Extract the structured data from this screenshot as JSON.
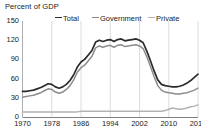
{
  "chart_data": {
    "type": "line",
    "title": "Percent of GDP",
    "xlabel": "",
    "ylabel": "Percent of GDP",
    "ylim": [
      0,
      150
    ],
    "xlim": [
      1970,
      2018
    ],
    "yticks": [
      0,
      30,
      60,
      90,
      120,
      150
    ],
    "xticks": [
      1970,
      1978,
      1986,
      1994,
      2002,
      2010,
      2018
    ],
    "grid": "vertical-major",
    "legend_position": "top",
    "x": [
      1970,
      1971,
      1972,
      1973,
      1974,
      1975,
      1976,
      1977,
      1978,
      1979,
      1980,
      1981,
      1982,
      1983,
      1984,
      1985,
      1986,
      1987,
      1988,
      1989,
      1990,
      1991,
      1992,
      1993,
      1994,
      1995,
      1996,
      1997,
      1998,
      1999,
      2000,
      2001,
      2002,
      2003,
      2004,
      2005,
      2006,
      2007,
      2008,
      2009,
      2010,
      2011,
      2012,
      2013,
      2014,
      2015,
      2016,
      2017,
      2018
    ],
    "series": [
      {
        "name": "Total",
        "color": "#2b2b2b",
        "values": [
          40,
          40,
          41,
          42,
          44,
          46,
          49,
          52,
          51,
          47,
          45,
          47,
          51,
          57,
          66,
          78,
          86,
          90,
          97,
          104,
          117,
          120,
          118,
          120,
          121,
          118,
          121,
          122,
          119,
          120,
          121,
          122,
          120,
          116,
          103,
          88,
          72,
          58,
          51,
          49,
          48,
          47,
          47,
          48,
          50,
          53,
          57,
          62,
          67
        ]
      },
      {
        "name": "Government",
        "color": "#8c8c8c",
        "values": [
          31,
          32,
          33,
          34,
          36,
          38,
          41,
          44,
          43,
          39,
          37,
          39,
          43,
          49,
          58,
          70,
          77,
          81,
          88,
          95,
          108,
          111,
          109,
          111,
          112,
          109,
          112,
          113,
          110,
          111,
          112,
          113,
          111,
          107,
          94,
          79,
          63,
          49,
          42,
          39,
          38,
          37,
          36,
          36,
          37,
          38,
          40,
          42,
          45
        ]
      },
      {
        "name": "Private",
        "color": "#b3b3b3",
        "values": [
          8,
          8,
          8,
          8,
          8,
          8,
          8,
          8,
          8,
          8,
          8,
          8,
          8,
          8,
          8,
          8,
          9,
          9,
          9,
          9,
          9,
          9,
          9,
          9,
          9,
          9,
          9,
          9,
          9,
          9,
          9,
          9,
          9,
          9,
          9,
          9,
          9,
          9,
          9,
          10,
          12,
          14,
          13,
          12,
          13,
          14,
          16,
          17,
          19
        ]
      }
    ]
  },
  "legend": {
    "items": [
      {
        "label": "Total"
      },
      {
        "label": "Government"
      },
      {
        "label": "Private"
      }
    ]
  }
}
